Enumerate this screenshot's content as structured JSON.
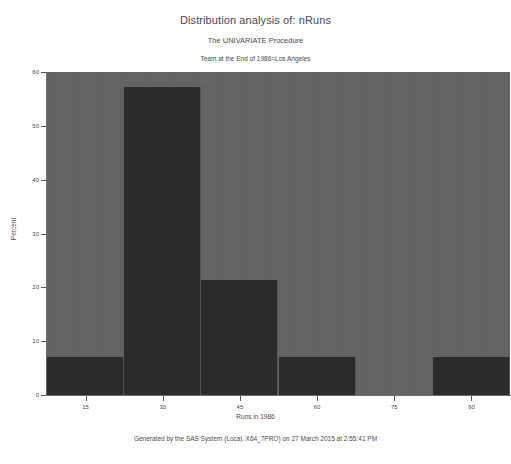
{
  "titles": {
    "main": "Distribution analysis of: nRuns",
    "procedure": "The UNIVARIATE Procedure",
    "by_line": "Team at the End of 1986=Los Angeles"
  },
  "footer": {
    "text": "Generated by the SAS System (Local, X64_7PRO) on 27 March 2015 at 2:55:41 PM"
  },
  "colors": {
    "page_background": "#ffffff",
    "plot_background": "#636363",
    "bar_fill": "#2b2b2b",
    "axis": "#6d6d6d",
    "text": "#4a4a4a"
  },
  "chart_data": {
    "type": "bar",
    "title": "Distribution analysis of: nRuns",
    "subtitle": "The UNIVARIATE Procedure",
    "annotations": [
      "Team at the End of 1986=Los Angeles"
    ],
    "xlabel": "Runs in 1986",
    "ylabel": "Percent",
    "xlim": [
      7.5,
      97.5
    ],
    "ylim": [
      0,
      60
    ],
    "bin_width": 15,
    "grid": false,
    "legend": null,
    "xticks": [
      15,
      30,
      45,
      60,
      75,
      90
    ],
    "xtick_labels": [
      "15",
      "30",
      "45",
      "60",
      "75",
      "90"
    ],
    "yticks": [
      0,
      10,
      20,
      30,
      40,
      50,
      60
    ],
    "ytick_labels": [
      "0",
      "10",
      "20",
      "30",
      "40",
      "50",
      "60"
    ],
    "categories": [
      "7.5-22.5",
      "22.5-37.5",
      "37.5-52.5",
      "52.5-67.5",
      "67.5-82.5",
      "82.5-97.5"
    ],
    "bin_midpoints": [
      15,
      30,
      45,
      60,
      75,
      90
    ],
    "bin_edges": [
      7.5,
      22.5,
      37.5,
      52.5,
      67.5,
      82.5,
      97.5
    ],
    "values": [
      7.14,
      57.14,
      21.43,
      7.14,
      0,
      7.14
    ],
    "counts": [
      1,
      8,
      3,
      1,
      0,
      1
    ],
    "total_count": 14
  },
  "bars": [
    {
      "label": "7.5-22.5",
      "percent": 7.14,
      "count": 1
    },
    {
      "label": "22.5-37.5",
      "percent": 57.14,
      "count": 8
    },
    {
      "label": "37.5-52.5",
      "percent": 21.43,
      "count": 3
    },
    {
      "label": "52.5-67.5",
      "percent": 7.14,
      "count": 1
    },
    {
      "label": "67.5-82.5",
      "percent": 0,
      "count": 0
    },
    {
      "label": "82.5-97.5",
      "percent": 7.14,
      "count": 1
    }
  ]
}
